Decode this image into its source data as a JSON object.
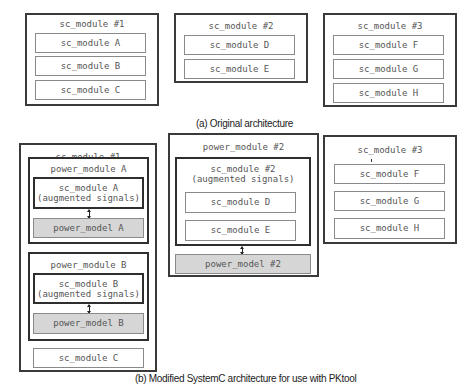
{
  "figure_a": {
    "caption": "(a) Original architecture",
    "modules": [
      {
        "title": "sc_module #1",
        "children": [
          "sc_module A",
          "sc_module B",
          "sc_module C"
        ]
      },
      {
        "title": "sc_module #2",
        "children": [
          "sc_module D",
          "sc_module E"
        ]
      },
      {
        "title": "sc_module #3",
        "children": [
          "sc_module F",
          "sc_module G",
          "sc_module H"
        ]
      }
    ]
  },
  "figure_b": {
    "caption": "(b) Modified SystemC architecture for use with PKtool",
    "module1": {
      "title": "sc_module #1",
      "power_module_a": {
        "title": "power_module A",
        "sc_module_line1": "sc_module A",
        "sc_module_line2": "(augmented signals)",
        "power_model": "power_model A"
      },
      "power_module_b": {
        "title": "power_module B",
        "sc_module_line1": "sc_module B",
        "sc_module_line2": "(augmented signals)",
        "power_model": "power_model B"
      },
      "sc_module_c": "sc_module C"
    },
    "module2": {
      "title": "power_module #2",
      "sc_module_line1": "sc_module #2",
      "sc_module_line2": "(augmented signals)",
      "children": [
        "sc_module D",
        "sc_module E"
      ],
      "power_model": "power_model #2"
    },
    "module3": {
      "title": "sc_module #3",
      "children": [
        "sc_module F",
        "sc_module G",
        "sc_module H"
      ]
    }
  }
}
